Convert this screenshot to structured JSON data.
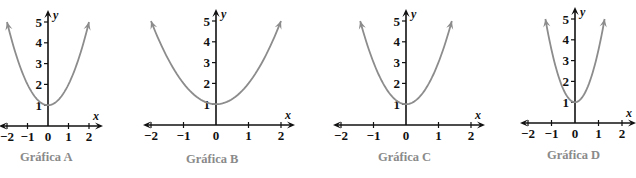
{
  "chart_data": [
    {
      "type": "line",
      "title": "Gráfica A",
      "xlabel": "x",
      "ylabel": "y",
      "x_ticks": [
        "−2",
        "−1",
        "0",
        "1",
        "2"
      ],
      "y_ticks": [
        "1",
        "2",
        "3",
        "4",
        "5"
      ],
      "xlim": [
        -2,
        2
      ],
      "ylim": [
        0,
        5
      ],
      "grid": false,
      "series": [
        {
          "name": "parabola",
          "equation_estimate": "y = x^2 + 1",
          "vertex": [
            0,
            1
          ],
          "x_range": [
            -2,
            2
          ],
          "endpoints": [
            [
              -2,
              5
            ],
            [
              2,
              5
            ]
          ]
        }
      ],
      "layout": {
        "origin": [
          48,
          126
        ],
        "px_per_x": 20.5,
        "px_per_y": 20.8,
        "caption_pos": [
          20,
          150
        ]
      }
    },
    {
      "type": "line",
      "title": "Gráfica B",
      "xlabel": "x",
      "ylabel": "y",
      "x_ticks": [
        "−2",
        "−1",
        "0",
        "1",
        "2"
      ],
      "y_ticks": [
        "1",
        "2",
        "3",
        "4",
        "5"
      ],
      "xlim": [
        -2,
        2
      ],
      "ylim": [
        0,
        5
      ],
      "grid": false,
      "series": [
        {
          "name": "parabola",
          "equation_estimate": "y = x^2 + 1",
          "vertex": [
            0,
            1
          ],
          "x_range": [
            -2,
            2
          ],
          "endpoints": [
            [
              -2,
              5
            ],
            [
              2,
              5
            ]
          ]
        }
      ],
      "layout": {
        "origin": [
          216,
          125
        ],
        "px_per_x": 32.5,
        "px_per_y": 20.8,
        "caption_pos": [
          186,
          152
        ]
      }
    },
    {
      "type": "line",
      "title": "Gráfica C",
      "xlabel": "x",
      "ylabel": "y",
      "x_ticks": [
        "−2",
        "−1",
        "0",
        "1",
        "2"
      ],
      "y_ticks": [
        "1",
        "2",
        "3",
        "4",
        "5"
      ],
      "xlim": [
        -2,
        2
      ],
      "ylim": [
        0,
        5
      ],
      "grid": false,
      "series": [
        {
          "name": "parabola",
          "equation_estimate": "y = 2x^2 + 1",
          "vertex": [
            0,
            1
          ],
          "x_range": [
            -1.41,
            1.41
          ],
          "endpoints": [
            [
              -1.41,
              5
            ],
            [
              1.41,
              5
            ]
          ]
        }
      ],
      "layout": {
        "origin": [
          406,
          125
        ],
        "px_per_x": 32.5,
        "px_per_y": 20.8,
        "caption_pos": [
          378,
          150
        ]
      }
    },
    {
      "type": "line",
      "title": "Gráfica D",
      "xlabel": "x",
      "ylabel": "y",
      "x_ticks": [
        "−2",
        "−1",
        "0",
        "1",
        "2"
      ],
      "y_ticks": [
        "1",
        "2",
        "3",
        "4",
        "5"
      ],
      "xlim": [
        -2,
        2
      ],
      "ylim": [
        0,
        5
      ],
      "grid": false,
      "series": [
        {
          "name": "parabola",
          "equation_estimate": "y = 2.5x^2 + 1",
          "vertex": [
            0,
            1
          ],
          "x_range": [
            -1.26,
            1.26
          ],
          "endpoints": [
            [
              -1.26,
              5
            ],
            [
              1.26,
              5
            ]
          ]
        }
      ],
      "layout": {
        "origin": [
          575,
          123
        ],
        "px_per_x": 23.5,
        "px_per_y": 20.8,
        "caption_pos": [
          547,
          148
        ]
      }
    }
  ],
  "colors": {
    "axis": "#111111",
    "curve": "#8c8c8c",
    "caption": "#8a8a8a",
    "ticks": "#111111"
  }
}
